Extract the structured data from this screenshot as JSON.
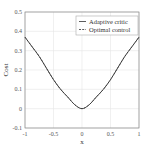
{
  "chart_data": {
    "type": "line",
    "title": "",
    "xlabel": "x",
    "ylabel": "Cost",
    "xlim": [
      -1,
      1
    ],
    "ylim": [
      -0.1,
      0.5
    ],
    "grid": true,
    "legend_position": "upper right",
    "x_ticks": [
      "-1",
      "-0.5",
      "0",
      "0.5",
      "1"
    ],
    "y_ticks": [
      "-0.1",
      "0",
      "0.1",
      "0.2",
      "0.3",
      "0.4",
      "0.5"
    ],
    "x": [
      -1.0,
      -0.875,
      -0.75,
      -0.625,
      -0.5,
      -0.375,
      -0.25,
      -0.125,
      0.0,
      0.125,
      0.25,
      0.375,
      0.5,
      0.625,
      0.75,
      0.875,
      1.0
    ],
    "series": [
      {
        "name": "Adaptive critic",
        "style": "solid",
        "color": "#333333",
        "values": [
          0.37,
          0.32,
          0.27,
          0.21,
          0.15,
          0.1,
          0.06,
          0.02,
          0.0,
          0.02,
          0.06,
          0.1,
          0.15,
          0.21,
          0.27,
          0.32,
          0.37
        ]
      },
      {
        "name": "Optimal control",
        "style": "dashed",
        "color": "#333333",
        "values": [
          0.37,
          0.32,
          0.27,
          0.21,
          0.15,
          0.1,
          0.06,
          0.02,
          0.0,
          0.02,
          0.06,
          0.1,
          0.15,
          0.21,
          0.27,
          0.32,
          0.37
        ]
      }
    ]
  },
  "legend": {
    "items": [
      {
        "label": "Adaptive critic"
      },
      {
        "label": "Optimal control"
      }
    ]
  },
  "axes": {
    "xlabel": "x",
    "ylabel": "Cost"
  }
}
